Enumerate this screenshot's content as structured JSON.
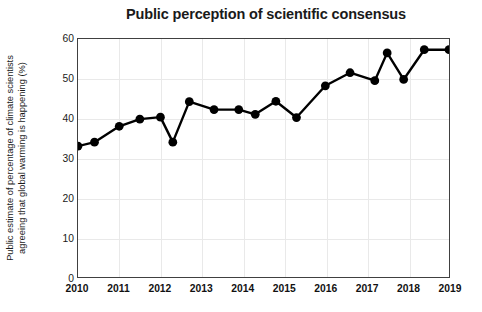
{
  "chart_data": {
    "type": "line",
    "title": "Public perception of scientific consensus",
    "xlabel": "",
    "ylabel": "Public estimate of percentage of climate scientists agreeing that global warming is happening (%)",
    "ylabel_line1": "Public estimate of percentage of climate scientists",
    "ylabel_line2": "agreeing that global warming is happening (%)",
    "xlim": [
      2010,
      2019
    ],
    "ylim": [
      0,
      60
    ],
    "yticks": [
      0,
      10,
      20,
      30,
      40,
      50,
      60
    ],
    "ytick_labels": [
      "0",
      "10",
      "20",
      "30",
      "40",
      "50",
      "60"
    ],
    "xticks": [
      2010,
      2011,
      2012,
      2013,
      2014,
      2015,
      2016,
      2017,
      2018,
      2019
    ],
    "xtick_labels": [
      "2010",
      "2011",
      "2012",
      "2013",
      "2014",
      "2015",
      "2016",
      "2017",
      "2018",
      "2019"
    ],
    "grid": true,
    "grid_color": "#e9e9e9",
    "legend": null,
    "series": [
      {
        "name": "Public estimate of scientific consensus",
        "color": "#000000",
        "marker": "circle",
        "x": [
          2010.0,
          2010.4,
          2011.0,
          2011.5,
          2012.0,
          2012.3,
          2012.7,
          2013.3,
          2013.9,
          2014.3,
          2014.8,
          2015.3,
          2016.0,
          2016.6,
          2017.2,
          2017.5,
          2017.9,
          2018.4,
          2019.0
        ],
        "values": [
          33.0,
          34.0,
          38.0,
          39.8,
          40.3,
          34.0,
          44.2,
          42.2,
          42.2,
          41.0,
          44.3,
          40.2,
          48.2,
          51.5,
          49.5,
          56.5,
          49.8,
          57.3,
          57.3
        ]
      }
    ],
    "points": [
      {
        "x": 2010.0,
        "y": 33.0
      },
      {
        "x": 2010.4,
        "y": 34.0
      },
      {
        "x": 2011.0,
        "y": 38.0
      },
      {
        "x": 2011.5,
        "y": 39.8
      },
      {
        "x": 2012.0,
        "y": 40.3
      },
      {
        "x": 2012.3,
        "y": 34.0
      },
      {
        "x": 2012.7,
        "y": 44.2
      },
      {
        "x": 2013.3,
        "y": 42.2
      },
      {
        "x": 2013.9,
        "y": 42.2
      },
      {
        "x": 2014.3,
        "y": 41.0
      },
      {
        "x": 2014.8,
        "y": 44.3
      },
      {
        "x": 2015.3,
        "y": 40.2
      },
      {
        "x": 2016.0,
        "y": 48.2
      },
      {
        "x": 2016.6,
        "y": 51.5
      },
      {
        "x": 2017.2,
        "y": 49.5
      },
      {
        "x": 2017.5,
        "y": 56.5
      },
      {
        "x": 2017.9,
        "y": 49.8
      },
      {
        "x": 2018.4,
        "y": 57.3
      },
      {
        "x": 2019.0,
        "y": 57.3
      }
    ]
  },
  "colors": {
    "series": "#000000",
    "axis": "#404040",
    "grid": "#e9e9e9",
    "text": "#1a1a1a",
    "background": "#ffffff"
  }
}
